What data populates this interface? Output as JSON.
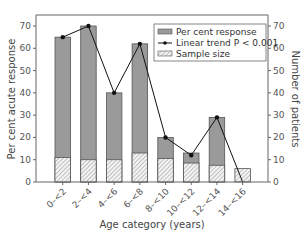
{
  "chart_data": {
    "type": "bar",
    "title": "",
    "xlabel": "Age category (years)",
    "ylabel": "Per cent acute response",
    "y2label": "Number of patients",
    "categories": [
      "0–<2",
      "2–<4",
      "4–<6",
      "6–<8",
      "8–<10",
      "10–<12",
      "12–<14",
      "14–<16"
    ],
    "series": [
      {
        "name": "Per cent response",
        "type": "bar",
        "values": [
          65,
          70,
          40,
          62,
          20,
          13,
          29,
          0
        ]
      },
      {
        "name": "Sample size",
        "type": "bar-hatched",
        "axis": "right",
        "values": [
          11,
          10,
          10,
          13,
          10.5,
          8.5,
          7.5,
          6
        ]
      },
      {
        "name": "Linear trend P < 0.001",
        "type": "line",
        "values": [
          65,
          70,
          40,
          62,
          20,
          12,
          29,
          0
        ]
      }
    ],
    "ylim": [
      0,
      70
    ],
    "y2lim": [
      0,
      70
    ],
    "yticks": [
      0,
      10,
      20,
      30,
      40,
      50,
      60,
      70
    ],
    "y2ticks": [
      0,
      10,
      20,
      30,
      40,
      50,
      60,
      70
    ],
    "grid": false,
    "legend_position": "upper right",
    "legend": [
      "Per cent response",
      "Linear trend P < 0.001",
      "Sample size"
    ],
    "colors": {
      "bar": "#9a9a9a",
      "bar_edge": "#555555",
      "hatch": "#888888",
      "line": "#111111",
      "axis": "#666666"
    }
  }
}
